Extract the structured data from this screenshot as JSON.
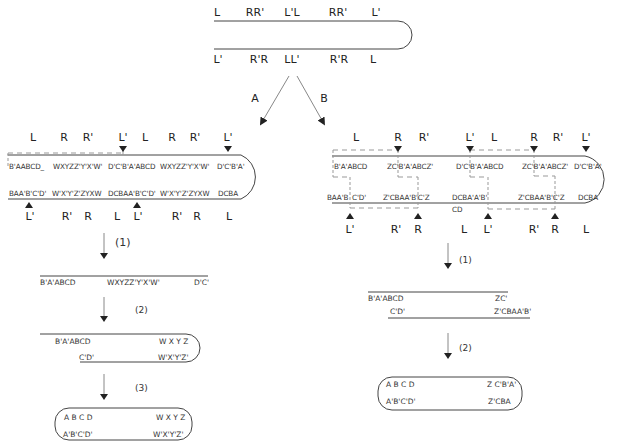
{
  "top": {
    "upper_labels": [
      "L",
      "RR'",
      "L'L",
      "RR'",
      "L'"
    ],
    "lower_labels": [
      "L'",
      "R'R",
      "LL'",
      "R'R",
      "L"
    ],
    "branch_a": "A",
    "branch_b": "B"
  },
  "panel_a": {
    "upper_labels": [
      "L",
      "R",
      "R'",
      "L'",
      "L",
      "R",
      "R'",
      "L'"
    ],
    "upper_seqs": [
      "B'AABCD_",
      "WXYZZ'Y'X'W'",
      "D'C'B'A'ABCD",
      "WXYZZ'Y'X'W'",
      "D'C'B'A'"
    ],
    "lower_seqs": [
      "BAA'B'C'D'",
      "W'X'Y'Z'ZYXW",
      "DCBAA'B'C'D'",
      "W'X'Y'Z'ZYXW",
      "DCBA"
    ],
    "lower_labels": [
      "L'",
      "R'",
      "R",
      "L",
      "L'",
      "R'",
      "R",
      "L"
    ],
    "step1": {
      "label": "(1)",
      "seqs": [
        "B'A'ABCD",
        "WXYZZ'Y'X'W'",
        "D'C'"
      ]
    },
    "step2": {
      "label": "(2)",
      "top": [
        "B'A'ABCD",
        "W X Y Z"
      ],
      "bottom": [
        "C'D'",
        "W'X'Y'Z'"
      ]
    },
    "step3": {
      "label": "(3)",
      "top": [
        "A B C D",
        "W X Y Z"
      ],
      "bottom": [
        "A'B'C'D'",
        "W'X'Y'Z'"
      ]
    }
  },
  "panel_b": {
    "upper_labels": [
      "L",
      "R",
      "R'",
      "L'",
      "L",
      "R",
      "R'",
      "L'"
    ],
    "upper_seqs": [
      "B'A'ABCD",
      "ZC'B'A'ABCZ'",
      "D'C'B'A'ABCD",
      "ZC'B'A'ABCZ'",
      "D'C'B'A'"
    ],
    "lower_seqs": [
      "BAA'B",
      "C'D'",
      "Z'CBAA'B'C'Z",
      "DCBA'A'B'",
      "Z'CBAA'B'C'Z",
      "DCBA"
    ],
    "lower_extra": "CD",
    "lower_labels": [
      "L'",
      "R'",
      "R",
      "L",
      "L'",
      "R'",
      "R",
      "L"
    ],
    "step1": {
      "label": "(1)",
      "top": [
        "B'A'ABCD",
        "ZC'"
      ],
      "bottom": [
        "C'D'",
        "Z'CBAA'B'"
      ]
    },
    "step2": {
      "label": "(2)",
      "top": [
        "A B C D",
        "Z C'B'A'"
      ],
      "bottom": [
        "A'B'C'D'",
        "Z'CBA"
      ]
    }
  },
  "colors": {
    "line": "#333333",
    "dashed": "#999999",
    "text": "#222222"
  }
}
